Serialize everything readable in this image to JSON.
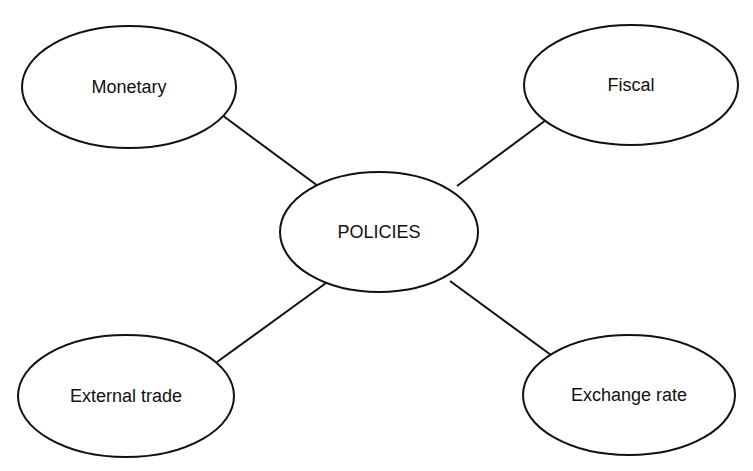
{
  "diagram": {
    "type": "hub-and-spoke mind map",
    "colors": {
      "stroke": "#111111",
      "fill": "#ffffff",
      "text": "#111111"
    },
    "center": {
      "label": "POLICIES",
      "cx": 379,
      "cy": 232,
      "rx": 99,
      "ry": 60
    },
    "nodes": [
      {
        "id": "monetary",
        "label": "Monetary",
        "cx": 129,
        "cy": 87,
        "rx": 107,
        "ry": 61
      },
      {
        "id": "fiscal",
        "label": "Fiscal",
        "cx": 631,
        "cy": 85,
        "rx": 107,
        "ry": 60
      },
      {
        "id": "external-trade",
        "label": "External trade",
        "cx": 126,
        "cy": 396,
        "rx": 108,
        "ry": 61
      },
      {
        "id": "exchange-rate",
        "label": "Exchange rate",
        "cx": 629,
        "cy": 395,
        "rx": 106,
        "ry": 60
      }
    ],
    "edges": [
      {
        "from": "monetary",
        "to": "center",
        "x1": 222,
        "y1": 115,
        "x2": 318,
        "y2": 186
      },
      {
        "from": "fiscal",
        "to": "center",
        "x1": 546,
        "y1": 120,
        "x2": 457,
        "y2": 186
      },
      {
        "from": "external-trade",
        "to": "center",
        "x1": 217,
        "y1": 362,
        "x2": 326,
        "y2": 283
      },
      {
        "from": "exchange-rate",
        "to": "center",
        "x1": 551,
        "y1": 355,
        "x2": 450,
        "y2": 281
      }
    ]
  }
}
